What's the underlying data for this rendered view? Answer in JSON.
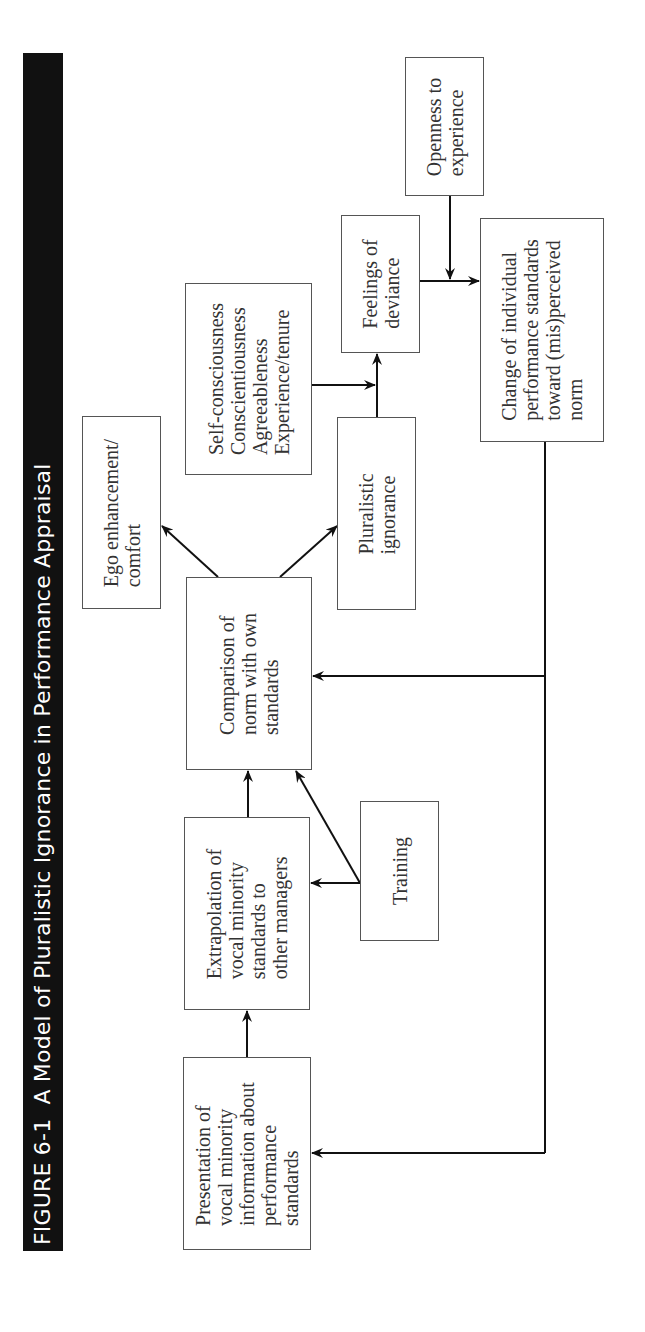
{
  "figure": {
    "number": "FIGURE 6-1",
    "title": "A Model of Pluralistic Ignorance in Performance Appraisal",
    "colors": {
      "title_bar": "#111111",
      "title_text": "#ffffff",
      "box_border": "#555555",
      "box_text": "#333333",
      "arrow": "#111111"
    }
  },
  "nodes": {
    "presentation": {
      "label": "Presentation of\nvocal minority\ninformation about\nperformance\nstandards"
    },
    "extrapolation": {
      "label": "Extrapolation of\nvocal minority\nstandards to\nother managers"
    },
    "training": {
      "label": "Training"
    },
    "comparison": {
      "label": "Comparison of\nnorm with own\nstandards"
    },
    "ego": {
      "label": "Ego enhancement/\ncomfort"
    },
    "pluralistic": {
      "label": "Pluralistic\nignorance"
    },
    "traits": {
      "label": "Self-consciousness\nConscientiousness\nAgreeableness\nExperience/tenure"
    },
    "feelings": {
      "label": "Feelings of\ndeviance"
    },
    "openness": {
      "label": "Openness to\nexperience"
    },
    "change": {
      "label": "Change of individual\nperformance standards\ntoward (mis)perceived\nnorm"
    }
  },
  "edges": [
    {
      "from": "presentation",
      "to": "extrapolation"
    },
    {
      "from": "extrapolation",
      "to": "comparison"
    },
    {
      "from": "training",
      "to": "extrapolation"
    },
    {
      "from": "training",
      "to": "comparison"
    },
    {
      "from": "comparison",
      "to": "ego"
    },
    {
      "from": "comparison",
      "to": "pluralistic"
    },
    {
      "from": "pluralistic",
      "to": "feelings"
    },
    {
      "from": "traits",
      "to": "feelings-edge"
    },
    {
      "from": "feelings",
      "to": "change"
    },
    {
      "from": "openness",
      "to": "feelings-change-edge"
    },
    {
      "from": "change",
      "to": "comparison"
    },
    {
      "from": "change",
      "to": "presentation"
    }
  ]
}
